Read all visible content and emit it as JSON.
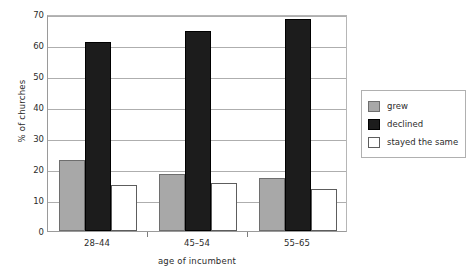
{
  "chart_data": {
    "type": "bar",
    "title": "",
    "xlabel": "age of incumbent",
    "ylabel": "% of churches",
    "categories": [
      "28–44",
      "45–54",
      "55–65"
    ],
    "series": [
      {
        "name": "grew",
        "values": [
          23,
          18.5,
          17
        ],
        "color": "#a8a8a8"
      },
      {
        "name": "declined",
        "values": [
          61,
          64.5,
          68.5
        ],
        "color": "#1c1c1c"
      },
      {
        "name": "stayed the same",
        "values": [
          14.7,
          15.6,
          13.4
        ],
        "color": "#ffffff"
      }
    ],
    "ylim": [
      0,
      70
    ],
    "yticks": [
      0,
      10,
      20,
      30,
      40,
      50,
      60,
      70
    ],
    "ytick_labels": [
      "0",
      "10",
      "20",
      "30",
      "40",
      "50",
      "60",
      "70"
    ],
    "grid": true,
    "legend_position": "right"
  }
}
